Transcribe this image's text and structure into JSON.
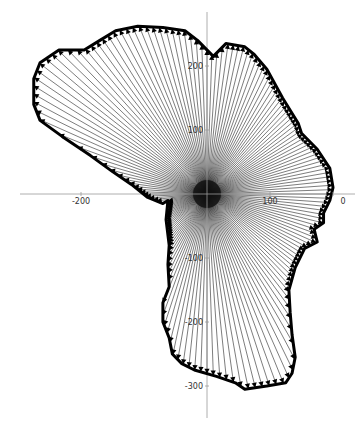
{
  "chart_data": {
    "type": "line",
    "title": "",
    "xlabel": "",
    "ylabel": "",
    "xlim": [
      -330,
      210
    ],
    "ylim": [
      -355,
      285
    ],
    "grid": false,
    "legend": "none",
    "x_ticks": [
      {
        "value": -200,
        "label": "-200"
      },
      {
        "value": 100,
        "label": "100"
      },
      {
        "value": 200,
        "label": "0"
      }
    ],
    "y_ticks": [
      {
        "value": 200,
        "label": "200"
      },
      {
        "value": 100,
        "label": "100"
      },
      {
        "value": -100,
        "label": "-100"
      },
      {
        "value": -200,
        "label": "-200"
      },
      {
        "value": -300,
        "label": "-300"
      }
    ],
    "ray_count": 180,
    "boundary": [
      [
        -15,
        240
      ],
      [
        10,
        215
      ],
      [
        30,
        235
      ],
      [
        60,
        230
      ],
      [
        75,
        218
      ],
      [
        95,
        195
      ],
      [
        120,
        150
      ],
      [
        145,
        110
      ],
      [
        150,
        95
      ],
      [
        175,
        70
      ],
      [
        195,
        40
      ],
      [
        200,
        10
      ],
      [
        195,
        -10
      ],
      [
        185,
        -30
      ],
      [
        185,
        -45
      ],
      [
        170,
        -55
      ],
      [
        175,
        -75
      ],
      [
        155,
        -85
      ],
      [
        140,
        -115
      ],
      [
        130,
        -150
      ],
      [
        132,
        -185
      ],
      [
        135,
        -220
      ],
      [
        140,
        -255
      ],
      [
        135,
        -280
      ],
      [
        125,
        -295
      ],
      [
        95,
        -300
      ],
      [
        60,
        -305
      ],
      [
        45,
        -295
      ],
      [
        15,
        -285
      ],
      [
        -20,
        -275
      ],
      [
        -40,
        -265
      ],
      [
        -55,
        -250
      ],
      [
        -60,
        -225
      ],
      [
        -70,
        -200
      ],
      [
        -70,
        -170
      ],
      [
        -60,
        -145
      ],
      [
        -62,
        -110
      ],
      [
        -60,
        -80
      ],
      [
        -65,
        -40
      ],
      [
        -62,
        -10
      ],
      [
        -70,
        -15
      ],
      [
        -95,
        -5
      ],
      [
        -120,
        15
      ],
      [
        -150,
        35
      ],
      [
        -185,
        60
      ],
      [
        -230,
        90
      ],
      [
        -265,
        115
      ],
      [
        -275,
        140
      ],
      [
        -275,
        180
      ],
      [
        -265,
        205
      ],
      [
        -235,
        225
      ],
      [
        -195,
        225
      ],
      [
        -170,
        240
      ],
      [
        -145,
        255
      ],
      [
        -110,
        262
      ],
      [
        -70,
        260
      ],
      [
        -35,
        255
      ]
    ]
  }
}
